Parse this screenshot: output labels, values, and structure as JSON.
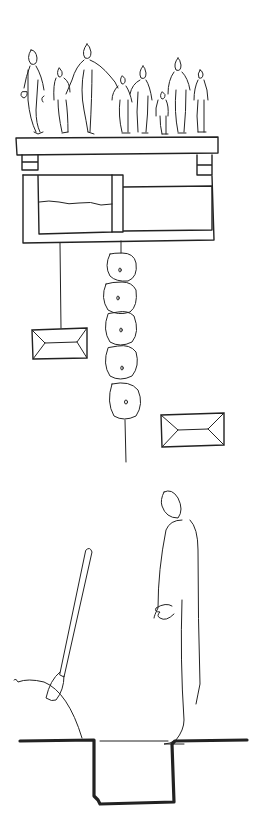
{
  "drawing": {
    "title": "Hand-drawn sketch",
    "description": "Ink sketch: group of people standing on a slab above a two-chamber box; hanging weights and a string of stacked stones; a lone figure beside a pit with a shovel in a mound of earth",
    "ink_color": "#222222",
    "background_color": "#ffffff",
    "sections": [
      {
        "name": "crowd-on-platform",
        "figures_count": 10
      },
      {
        "name": "hanging-elements",
        "left_weight": "rectangle weight",
        "stones_count": 5,
        "right_weight": "rectangle weight"
      },
      {
        "name": "figure-at-pit",
        "elements": [
          "standing figure",
          "shovel",
          "earth mound",
          "pit"
        ]
      }
    ]
  }
}
